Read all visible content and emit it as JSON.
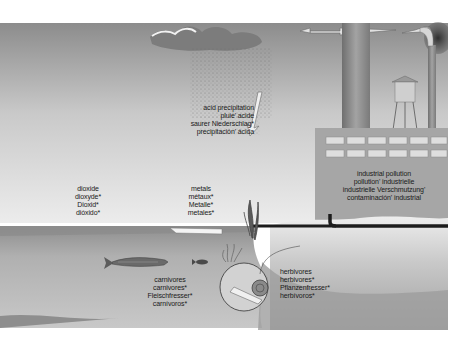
{
  "diagram": {
    "labels": {
      "acid_precipitation": [
        "acid precipitation",
        "pluie' acide",
        "saurer Niederschlag*",
        "precipitación' ácida"
      ],
      "dioxide": [
        "dioxide",
        "dioxyde*",
        "Dioxid*",
        "dióxido*"
      ],
      "metals": [
        "metals",
        "métaux*",
        "Metalle*",
        "metales*"
      ],
      "industrial_pollution": [
        "industrial pollution",
        "pollution' industrielle",
        "industrielle Verschmutzung'",
        "contaminación' industrial"
      ],
      "carnivores": [
        "carnivores",
        "carnivores*",
        "Fleischfresser*",
        "carnívoros*"
      ],
      "herbivores": [
        "herbivores",
        "herbivores*",
        "Pflanzenfresser*",
        "herbívoros*"
      ]
    },
    "colors": {
      "sky_top": "#8f8f8f",
      "sky_bottom": "#e6e6e6",
      "water_surface": "#9a9a9a",
      "water_deep": "#bdbdbd",
      "lakebed": "#a8a8a8",
      "factory": "#a9a9a9",
      "smokestack": "#8a8a8a",
      "pipe": "#1c1c1c",
      "cloud": "#7a7a7a",
      "smoke": "#3a3a3a"
    }
  }
}
